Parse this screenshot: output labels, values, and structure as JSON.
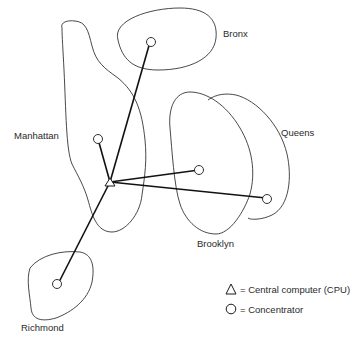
{
  "diagram": {
    "regions": [
      {
        "name": "Bronx",
        "label": "Bronx"
      },
      {
        "name": "Manhattan",
        "label": "Manhattan"
      },
      {
        "name": "Queens",
        "label": "Queens"
      },
      {
        "name": "Brooklyn",
        "label": "Brooklyn"
      },
      {
        "name": "Richmond",
        "label": "Richmond"
      }
    ],
    "legend": {
      "cpu": {
        "symbol": "triangle",
        "text": "= Central computer (CPU)"
      },
      "concentrator": {
        "symbol": "circle",
        "text": "= Concentrator"
      }
    },
    "colors": {
      "stroke": "#1a1a1a",
      "background": "#ffffff"
    }
  }
}
